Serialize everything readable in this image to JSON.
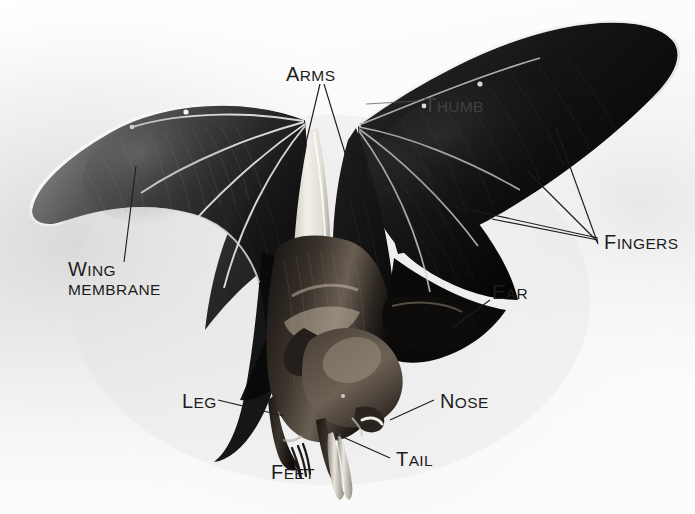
{
  "figure": {
    "kind": "annotated-photograph",
    "view": "ventral, wings spread, hanging head-down",
    "background_color": "#fdfdfd",
    "shadow_color": "#d8d8d8",
    "ink_color": "#1d1d1d",
    "body_color": "#0b0b0b",
    "membrane_color": "#171717",
    "highlight_color": "#f2f2f2",
    "fur_color": "#2a2520"
  },
  "labels": [
    {
      "id": "arms",
      "text": "Arms",
      "head": "A",
      "rest": "RMS",
      "x": 286,
      "y": 64,
      "style": "dark",
      "leaders": 2
    },
    {
      "id": "thumb",
      "text": "Thumb",
      "head": "T",
      "rest": "HUMB",
      "x": 424,
      "y": 95,
      "style": "faint",
      "leaders": 1
    },
    {
      "id": "fingers",
      "text": "Fingers",
      "head": "F",
      "rest": "INGERS",
      "x": 604,
      "y": 232,
      "style": "dark",
      "leaders": 4
    },
    {
      "id": "wing-membrane",
      "text": "Wing Membrane",
      "head": "W",
      "rest": "ING",
      "line2": "MEMBRANE",
      "x": 68,
      "y": 257,
      "style": "dark",
      "leaders": 1
    },
    {
      "id": "ear",
      "text": "Ear",
      "head": "E",
      "rest": "AR",
      "x": 492,
      "y": 282,
      "style": "dark",
      "leaders": 1
    },
    {
      "id": "leg",
      "text": "Leg",
      "head": "L",
      "rest": "EG",
      "x": 182,
      "y": 391,
      "style": "dark",
      "leaders": 1
    },
    {
      "id": "nose",
      "text": "Nose",
      "head": "N",
      "rest": "OSE",
      "x": 440,
      "y": 391,
      "style": "dark",
      "leaders": 1
    },
    {
      "id": "tail",
      "text": "Tail",
      "head": "T",
      "rest": "AIL",
      "x": 396,
      "y": 449,
      "style": "dark",
      "leaders": 1
    },
    {
      "id": "feet",
      "text": "Feet",
      "head": "F",
      "rest": "EET",
      "x": 271,
      "y": 462,
      "style": "dark",
      "leaders": 0
    }
  ]
}
